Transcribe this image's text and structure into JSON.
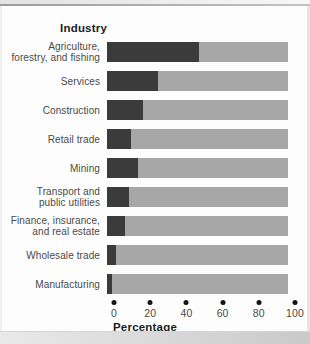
{
  "chart_data": {
    "type": "bar",
    "orientation": "horizontal",
    "stacked": true,
    "grid": false,
    "legend": "none",
    "title": "Industry",
    "xlabel": "Percentage",
    "xlim": [
      0,
      100
    ],
    "x_ticks": [
      0,
      20,
      40,
      60,
      80,
      100
    ],
    "categories": [
      "Agriculture,\nforestry, and fishing",
      "Services",
      "Construction",
      "Retail trade",
      "Mining",
      "Transport and\npublic utilities",
      "Finance, insurance,\nand real estate",
      "Wholesale trade",
      "Manufacturing"
    ],
    "series": [
      {
        "name": "dark segment",
        "color": "#3b3b3b",
        "values": [
          51,
          28,
          20,
          13,
          17,
          12,
          10,
          5,
          3
        ]
      },
      {
        "name": "light segment (remainder to 100%)",
        "color": "#a7a7a7",
        "values": [
          49,
          72,
          80,
          87,
          83,
          88,
          90,
          95,
          97
        ]
      }
    ]
  },
  "colors": {
    "dark_segment": "#3b3b3b",
    "light_segment": "#a7a7a7",
    "axis_dot": "#141414",
    "label_text": "#4a4a4a",
    "heading_text": "#1c1c1c"
  }
}
